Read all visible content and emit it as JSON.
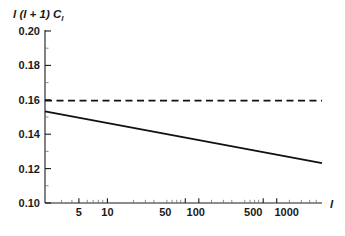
{
  "chart_data": {
    "type": "line",
    "title": "",
    "xlabel": "l",
    "ylabel": "l (l + 1) C_l",
    "ylabel_main": "l (l + 1) C",
    "ylabel_sub": "l",
    "xscale": "log",
    "yscale": "linear",
    "xlim": [
      2,
      2000
    ],
    "ylim": [
      0.1,
      0.2
    ],
    "grid": false,
    "legend": "none",
    "yticks": [
      0.1,
      0.12,
      0.14,
      0.16,
      0.18,
      0.2
    ],
    "ytick_labels": [
      "0.10",
      "0.12",
      "0.14",
      "0.16",
      "0.18",
      "0.20"
    ],
    "xticks": [
      5,
      10,
      50,
      100,
      500,
      1000
    ],
    "xtick_labels": [
      "5",
      "10",
      "50",
      "100",
      "500",
      "1000"
    ],
    "x_minor_ticks": [
      3,
      4,
      6,
      7,
      8,
      9,
      20,
      30,
      40,
      60,
      70,
      80,
      90,
      200,
      300,
      400,
      600,
      700,
      800,
      900,
      2000
    ],
    "y_minor_ticks": [
      0.105,
      0.115,
      0.125,
      0.135,
      0.145,
      0.155,
      0.165,
      0.175,
      0.185,
      0.195
    ],
    "series": [
      {
        "name": "reference-level",
        "style": "dashed",
        "color": "#111111",
        "x": [
          2,
          2000
        ],
        "values": [
          0.1595,
          0.1595
        ]
      },
      {
        "name": "spectrum",
        "style": "solid",
        "color": "#111111",
        "x": [
          2,
          2000
        ],
        "values": [
          0.1533,
          0.1232
        ]
      }
    ]
  }
}
